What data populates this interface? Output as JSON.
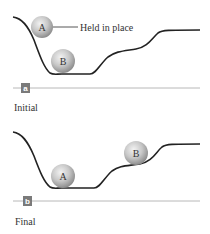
{
  "panels": [
    {
      "id": "a",
      "badge": "a",
      "caption": "Initial",
      "balls": [
        {
          "label": "A",
          "note": "Held in place"
        },
        {
          "label": "B"
        }
      ]
    },
    {
      "id": "b",
      "badge": "b",
      "caption": "Final",
      "balls": [
        {
          "label": "A"
        },
        {
          "label": "B"
        }
      ]
    }
  ],
  "colors": {
    "curve": "#222222",
    "baseline": "#b8b8b8",
    "badge_bg": "#7a7a7a",
    "badge_text": "#ffffff",
    "ball_light": "#eeeeee",
    "ball_dark": "#9c9c9c",
    "text": "#333333"
  }
}
